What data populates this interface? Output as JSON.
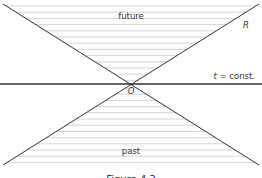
{
  "diagram": {
    "type": "light-cone",
    "labels": {
      "future": "future",
      "past": "past",
      "origin": "O",
      "cone_line": "R",
      "slice_var": "t",
      "slice_rest": " = const."
    },
    "caption": "Figure 4.3",
    "colors": {
      "line": "#333333",
      "hatch": "#c8c8c8",
      "text": "#333333"
    },
    "geometry": {
      "origin": [
        131,
        84
      ],
      "top_y": 4,
      "bottom_y": 165,
      "left_x": 3,
      "right_x": 259,
      "hatch_spacing": 6.2
    }
  }
}
